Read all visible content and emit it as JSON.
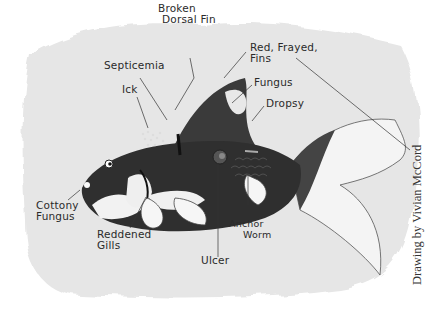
{
  "diagram": {
    "labels": [
      {
        "id": "broken-dorsal-fin",
        "line1": "Broken",
        "line2": "Dorsal Fin"
      },
      {
        "id": "red-frayed-fins",
        "line1": "Red, Frayed,",
        "line2": "Fins"
      },
      {
        "id": "septicemia",
        "line1": "Septicemia"
      },
      {
        "id": "fungus",
        "line1": "Fungus"
      },
      {
        "id": "ick",
        "line1": "Ick"
      },
      {
        "id": "dropsy",
        "line1": "Dropsy"
      },
      {
        "id": "cottony-fungus",
        "line1": "Cottony",
        "line2": "Fungus"
      },
      {
        "id": "reddened-gills",
        "line1": "Reddened",
        "line2": "Gills"
      },
      {
        "id": "ulcer",
        "line1": "Ulcer"
      },
      {
        "id": "anchor-worm",
        "line1": "Anchor",
        "line2": "Worm"
      }
    ],
    "credit": "Drawing by Vivian McCord"
  }
}
